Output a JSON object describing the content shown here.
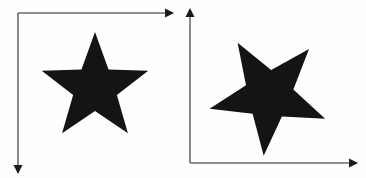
{
  "figure": {
    "title": "",
    "width": 366,
    "height": 178,
    "background_color": "#fefefe",
    "shape_color": "#141414",
    "axis_color": "#6b6b6b",
    "arrow_color": "#1a1a1a"
  },
  "panels": [
    {
      "id": "left-panel",
      "name": "original-star-panel",
      "label": "",
      "axes": {
        "origin": {
          "x": 18,
          "y": 13
        },
        "horizontal_axis": {
          "name": "top-horizontal-axis",
          "from": {
            "x": 18,
            "y": 13
          },
          "to": {
            "x": 170,
            "y": 13
          },
          "direction": "right",
          "arrow": true,
          "length": 152
        },
        "vertical_axis": {
          "name": "left-vertical-axis",
          "from": {
            "x": 18,
            "y": 13
          },
          "to": {
            "x": 18,
            "y": 170
          },
          "direction": "down",
          "arrow": true,
          "length": 157
        }
      },
      "shape": {
        "name": "five-pointed-star",
        "type": "star",
        "points": 5,
        "center": {
          "x": 95,
          "y": 88
        },
        "outer_radius": 56,
        "inner_radius": 23,
        "rotation_deg": 0,
        "orientation": "point-up",
        "fill": "#141414"
      }
    },
    {
      "id": "right-panel",
      "name": "rotated-star-panel",
      "label": "",
      "axes": {
        "origin": {
          "x": 190,
          "y": 163
        },
        "horizontal_axis": {
          "name": "bottom-horizontal-axis",
          "from": {
            "x": 190,
            "y": 163
          },
          "to": {
            "x": 354,
            "y": 163
          },
          "direction": "right",
          "arrow": true,
          "length": 164
        },
        "vertical_axis": {
          "name": "left-vertical-axis",
          "from": {
            "x": 190,
            "y": 163
          },
          "to": {
            "x": 190,
            "y": 12
          },
          "direction": "up",
          "arrow": true,
          "length": 151
        }
      },
      "shape": {
        "name": "five-pointed-star",
        "type": "star",
        "points": 5,
        "center": {
          "x": 269,
          "y": 95
        },
        "outer_radius": 61,
        "inner_radius": 25,
        "rotation_deg": 185,
        "orientation": "point-down",
        "fill": "#141414"
      }
    }
  ],
  "arrow_style": {
    "head_length": 9,
    "head_half_width": 4.5,
    "line_width": 1.6
  }
}
